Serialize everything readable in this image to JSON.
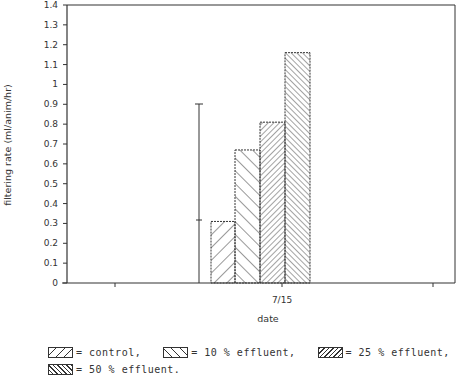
{
  "chart_data": {
    "type": "bar",
    "title": "",
    "xlabel": "date",
    "ylabel": "filtering rate (ml/anim/hr)",
    "categories": [
      "7/15"
    ],
    "ylim": [
      0,
      1.4
    ],
    "yticks": [
      "0",
      "0.1",
      "0.2",
      "0.3",
      "0.4",
      "0.5",
      "0.6",
      "0.7",
      "0.8",
      "0.9",
      "1",
      "1.1",
      "1.2",
      "1.3",
      "1.4"
    ],
    "grid": false,
    "legend_position": "bottom",
    "series": [
      {
        "name": "control",
        "values": [
          0.31
        ],
        "pattern": "sparse-forward-hatch"
      },
      {
        "name": "10 % effluent",
        "values": [
          0.67
        ],
        "pattern": "sparse-back-hatch"
      },
      {
        "name": "25 % effluent",
        "values": [
          0.81
        ],
        "pattern": "dense-forward-hatch"
      },
      {
        "name": "50 % effluent",
        "values": [
          1.16
        ],
        "pattern": "dense-back-hatch"
      }
    ],
    "error_bar": {
      "x_position": "left of 7/15 bars",
      "mean": 0.32,
      "upper": 0.9,
      "lower": 0
    }
  },
  "axes": {
    "ylabel": "filtering rate (ml/anim/hr)",
    "xlabel": "date",
    "xtick_label": "7/15"
  },
  "legend": {
    "items": [
      {
        "swatch": "control-swatch",
        "label": "= control,"
      },
      {
        "swatch": "10-effluent-swatch",
        "label": "= 10 % effluent,"
      },
      {
        "swatch": "25-effluent-swatch",
        "label": "= 25 % effluent,"
      },
      {
        "swatch": "50-effluent-swatch",
        "label": "= 50 % effluent."
      }
    ]
  },
  "colors": {
    "ink": "#333333",
    "background": "#ffffff"
  }
}
